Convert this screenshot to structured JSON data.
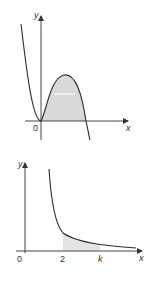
{
  "figures": [
    {
      "id": "cubic",
      "description": "Cubic curve through origin touching x-axis at 0, with shaded region between curve and x-axis from 0 to the positive root",
      "axis_labels": {
        "x": "x",
        "y": "y"
      },
      "origin_label": "0",
      "shaded_region": {
        "from": "0",
        "to": "root"
      },
      "colors": {
        "curve": "#2b2b2b",
        "axis": "#333333",
        "shade": "#d9d9d9"
      }
    },
    {
      "id": "reciprocal",
      "description": "Decreasing reciprocal-type curve with shaded area under curve from x = 2 to x = k",
      "axis_labels": {
        "x": "x",
        "y": "y"
      },
      "origin_label": "0",
      "tick_labels": [
        "2",
        "k"
      ],
      "shaded_region": {
        "from": "2",
        "to": "k"
      },
      "colors": {
        "curve": "#2b2b2b",
        "axis": "#333333",
        "shade": "#e3e3e3"
      }
    }
  ]
}
